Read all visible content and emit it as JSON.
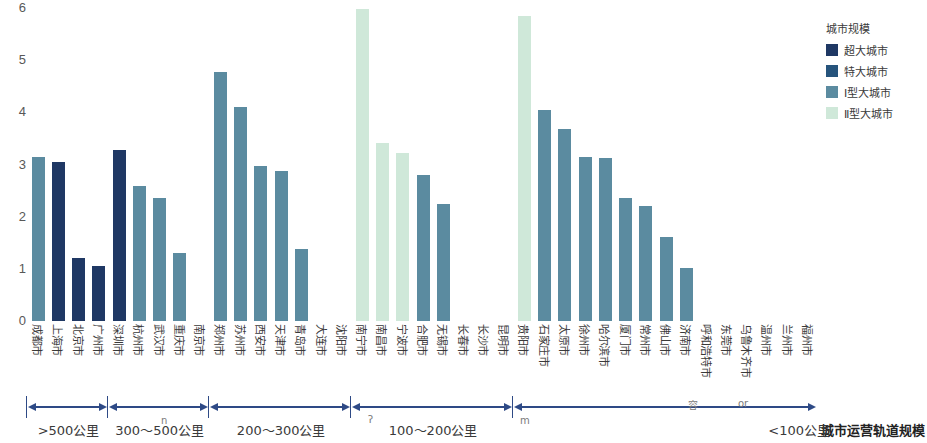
{
  "chart_data": {
    "type": "bar",
    "title": "",
    "xlabel": "城市运营轨道规模",
    "ylabel": "",
    "ylim": [
      0,
      6
    ],
    "yticks": [
      "0",
      "1",
      "2",
      "3",
      "4",
      "5",
      "6"
    ],
    "grid": false,
    "legend_position": "right",
    "categories": [
      "成都市",
      "上海市",
      "北京市",
      "广州市",
      "深圳市",
      "杭州市",
      "武汉市",
      "重庆市",
      "南京市",
      "郑州市",
      "苏州市",
      "西安市",
      "天津市",
      "青岛市",
      "大连市",
      "沈阳市",
      "南宁市",
      "南昌市",
      "宁波市",
      "合肥市",
      "无锡市",
      "长春市",
      "长沙市",
      "昆明市",
      "贵阳市",
      "石家庄市",
      "太原市",
      "徐州市",
      "哈尔滨市",
      "厦门市",
      "常州市",
      "佛山市",
      "济南市",
      "呼和浩特市",
      "东莞市",
      "乌鲁木齐市",
      "温州市",
      "兰州市",
      "福州市"
    ],
    "values": [
      3.15,
      3.05,
      1.2,
      1.05,
      3.28,
      2.58,
      2.35,
      1.3,
      0,
      4.78,
      4.1,
      2.98,
      2.88,
      1.38,
      0,
      0,
      5.98,
      3.42,
      3.22,
      2.8,
      2.25,
      0,
      0,
      0,
      5.85,
      4.05,
      3.68,
      3.15,
      3.12,
      2.35,
      2.2,
      1.62,
      1.02,
      0,
      0,
      0,
      0,
      0,
      0
    ],
    "series_class": [
      "i",
      "chaoda",
      "chaoda",
      "chaoda",
      "chaoda",
      "i",
      "i",
      "i",
      "i",
      "i",
      "i",
      "i",
      "i",
      "i",
      "i",
      "i",
      "ii",
      "ii",
      "ii",
      "i",
      "i",
      "i",
      "i",
      "i",
      "ii",
      "i",
      "i",
      "i",
      "i",
      "i",
      "i",
      "i",
      "i",
      "i",
      "i",
      "i",
      "i",
      "i",
      "i"
    ],
    "legend": {
      "title": "城市规模",
      "entries": [
        {
          "key": "chaoda",
          "label": "超大城市",
          "color": "#1f3864"
        },
        {
          "key": "teda",
          "label": "特大城市",
          "color": "#26547c"
        },
        {
          "key": "i",
          "label": "Ⅰ型大城市",
          "color": "#5b8ba0"
        },
        {
          "key": "ii",
          "label": "Ⅱ型大城市",
          "color": "#cfe8d9"
        }
      ]
    },
    "groups": [
      {
        "label": ">500公里",
        "start": 0,
        "end": 3
      },
      {
        "label": "300～500公里",
        "start": 4,
        "end": 8
      },
      {
        "label": "200～300公里",
        "start": 9,
        "end": 15
      },
      {
        "label": "100～200公里",
        "start": 16,
        "end": 23
      },
      {
        "label": "<100公里",
        "start": 24,
        "end": 38
      }
    ]
  },
  "artifacts": [
    {
      "text": "n",
      "x": 161,
      "y": 415
    },
    {
      "text": "ʔ",
      "x": 368,
      "y": 414
    },
    {
      "text": "m",
      "x": 520,
      "y": 415
    },
    {
      "text": "容",
      "x": 688,
      "y": 397
    },
    {
      "text": "or",
      "x": 738,
      "y": 398
    }
  ]
}
